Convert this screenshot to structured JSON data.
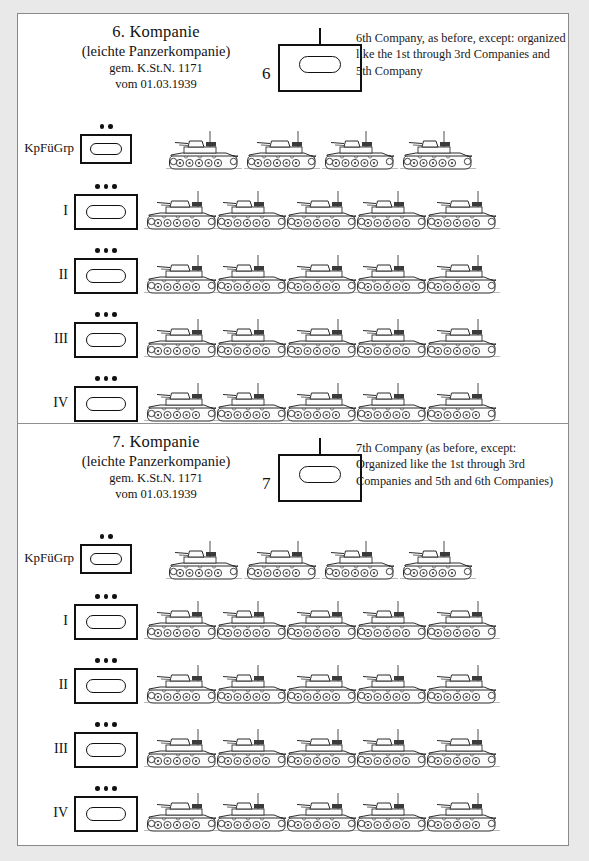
{
  "page": {
    "background": "#e9e9e9",
    "paper": "#ffffff",
    "ink": "#111111"
  },
  "sections": [
    {
      "id": "company-6",
      "header": {
        "title_de_line1": "6. Kompanie",
        "title_de_line2": "(leichte Panzerkompanie)",
        "title_de_line3": "gem. K.St.N. 1171",
        "title_de_line4": "vom 01.03.1939",
        "symbol_number": "6",
        "symbol_name": "armor-company-symbol",
        "description": "6th Company, as before, except: organized like the 1st through 3rd Companies and 5th Company"
      },
      "rows": [
        {
          "label": "KpFüGrp",
          "dots": 2,
          "tanks": 4,
          "box_w": 52,
          "box_h": 30
        },
        {
          "label": "I",
          "dots": 3,
          "tanks": 5,
          "box_w": 64,
          "box_h": 36
        },
        {
          "label": "II",
          "dots": 3,
          "tanks": 5,
          "box_w": 64,
          "box_h": 36
        },
        {
          "label": "III",
          "dots": 3,
          "tanks": 5,
          "box_w": 64,
          "box_h": 36
        },
        {
          "label": "IV",
          "dots": 3,
          "tanks": 5,
          "box_w": 64,
          "box_h": 36
        }
      ]
    },
    {
      "id": "company-7",
      "header": {
        "title_de_line1": "7. Kompanie",
        "title_de_line2": "(leichte Panzerkompanie)",
        "title_de_line3": "gem. K.St.N. 1171",
        "title_de_line4": "vom 01.03.1939",
        "symbol_number": "7",
        "symbol_name": "armor-company-symbol",
        "description": "7th Company (as before, except: Organized like the 1st through 3rd Companies and 5th and 6th Companies)"
      },
      "rows": [
        {
          "label": "KpFüGrp",
          "dots": 2,
          "tanks": 4,
          "box_w": 52,
          "box_h": 30
        },
        {
          "label": "I",
          "dots": 3,
          "tanks": 5,
          "box_w": 64,
          "box_h": 36
        },
        {
          "label": "II",
          "dots": 3,
          "tanks": 5,
          "box_w": 64,
          "box_h": 36
        },
        {
          "label": "III",
          "dots": 3,
          "tanks": 5,
          "box_w": 64,
          "box_h": 36
        },
        {
          "label": "IV",
          "dots": 3,
          "tanks": 5,
          "box_w": 64,
          "box_h": 36
        }
      ]
    }
  ]
}
